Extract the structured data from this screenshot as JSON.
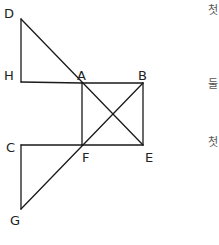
{
  "diagram": {
    "stroke_color": "#1a1a1a",
    "label_color": "#222222",
    "points": {
      "D": {
        "x": 21,
        "y": 19,
        "label": "D",
        "lx": 4,
        "ly": 18
      },
      "H": {
        "x": 21,
        "y": 82,
        "label": "H",
        "lx": 4,
        "ly": 80
      },
      "A": {
        "x": 82,
        "y": 83,
        "label": "A",
        "lx": 77,
        "ly": 80
      },
      "B": {
        "x": 143,
        "y": 83,
        "label": "B",
        "lx": 138,
        "ly": 80
      },
      "C": {
        "x": 21,
        "y": 145,
        "label": "C",
        "lx": 6,
        "ly": 152
      },
      "F": {
        "x": 82,
        "y": 145,
        "label": "F",
        "lx": 82,
        "ly": 162
      },
      "E": {
        "x": 143,
        "y": 145,
        "label": "E",
        "lx": 145,
        "ly": 162
      },
      "G": {
        "x": 21,
        "y": 209,
        "label": "G",
        "lx": 10,
        "ly": 225
      }
    },
    "segments": [
      [
        "D",
        "H"
      ],
      [
        "H",
        "A"
      ],
      [
        "D",
        "E"
      ],
      [
        "A",
        "B"
      ],
      [
        "B",
        "E"
      ],
      [
        "E",
        "F"
      ],
      [
        "F",
        "A"
      ],
      [
        "B",
        "G"
      ],
      [
        "C",
        "F"
      ],
      [
        "C",
        "G"
      ]
    ]
  },
  "side_notes": [
    {
      "text": "첫",
      "x": 208,
      "y": 14
    },
    {
      "text": "둘",
      "x": 208,
      "y": 88
    },
    {
      "text": "첫",
      "x": 208,
      "y": 146
    }
  ]
}
